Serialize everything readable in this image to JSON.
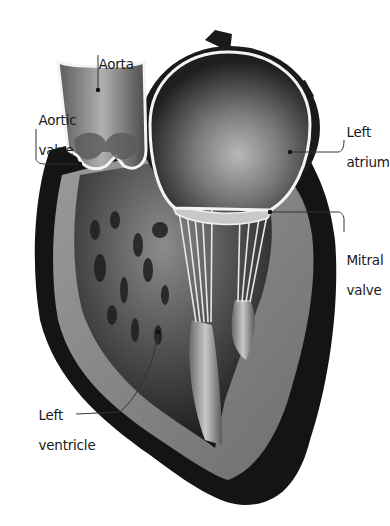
{
  "diagram": {
    "style": "grayscale illustration",
    "colors": {
      "background": "#ffffff",
      "outer_wall": "#141414",
      "muscle": "#8a8a8a",
      "chamber_dark": "#2a2a2a",
      "highlight": "#f2f2f2",
      "leader_line": "#333333"
    },
    "labels": [
      {
        "id": "aorta",
        "line1": "Aorta",
        "line2": ""
      },
      {
        "id": "aortic-valve",
        "line1": "Aortic",
        "line2": "valve"
      },
      {
        "id": "left-atrium",
        "line1": "Left",
        "line2": "atrium"
      },
      {
        "id": "mitral-valve",
        "line1": "Mitral",
        "line2": "valve"
      },
      {
        "id": "left-ventricle",
        "line1": "Left",
        "line2": "ventricle"
      }
    ]
  }
}
